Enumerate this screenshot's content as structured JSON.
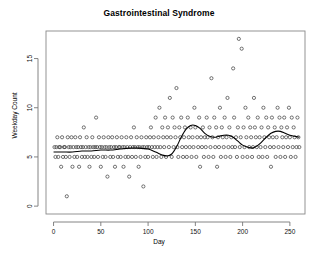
{
  "chart_data": {
    "type": "scatter",
    "title": "Gastrointestinal Syndrome",
    "xlabel": "Day",
    "ylabel": "Weekday Count",
    "xlim": [
      -8,
      266
    ],
    "ylim": [
      -0.8,
      17.8
    ],
    "xticks": [
      0,
      50,
      100,
      150,
      200,
      250
    ],
    "yticks": [
      0,
      5,
      10,
      15
    ],
    "xtick_labels": [
      "0",
      "50",
      "100",
      "150",
      "200",
      "250"
    ],
    "ytick_labels": [
      "0",
      "5",
      "10",
      "15"
    ],
    "grid": false,
    "legend": null,
    "marker": "open-circle",
    "marker_color": "#3a3a3a",
    "marker_radius": 1.6,
    "line_color": "#000000",
    "frame_color": "#888888",
    "series": [
      {
        "name": "Weekday Count",
        "type": "scatter",
        "x": [
          1,
          2,
          3,
          4,
          5,
          6,
          7,
          8,
          9,
          10,
          11,
          12,
          13,
          14,
          15,
          16,
          17,
          18,
          19,
          20,
          21,
          22,
          23,
          24,
          25,
          26,
          27,
          28,
          29,
          30,
          31,
          32,
          33,
          34,
          35,
          36,
          37,
          38,
          39,
          40,
          41,
          42,
          43,
          44,
          45,
          46,
          47,
          48,
          49,
          50,
          51,
          52,
          53,
          54,
          55,
          56,
          57,
          58,
          59,
          60,
          61,
          62,
          63,
          64,
          65,
          66,
          67,
          68,
          69,
          70,
          71,
          72,
          73,
          74,
          75,
          76,
          77,
          78,
          79,
          80,
          81,
          82,
          83,
          84,
          85,
          86,
          87,
          88,
          89,
          90,
          91,
          92,
          93,
          94,
          95,
          96,
          97,
          98,
          99,
          100,
          101,
          102,
          103,
          104,
          105,
          106,
          107,
          108,
          109,
          110,
          111,
          112,
          113,
          114,
          115,
          116,
          117,
          118,
          119,
          120,
          121,
          122,
          123,
          124,
          125,
          126,
          127,
          128,
          129,
          130,
          131,
          132,
          133,
          134,
          135,
          136,
          137,
          138,
          139,
          140,
          141,
          142,
          143,
          144,
          145,
          146,
          147,
          148,
          149,
          150,
          151,
          152,
          153,
          154,
          155,
          156,
          157,
          158,
          159,
          160,
          161,
          162,
          163,
          164,
          165,
          166,
          167,
          168,
          169,
          170,
          171,
          172,
          173,
          174,
          175,
          176,
          177,
          178,
          179,
          180,
          181,
          182,
          183,
          184,
          185,
          186,
          187,
          188,
          189,
          190,
          191,
          192,
          193,
          194,
          195,
          196,
          197,
          198,
          199,
          200,
          201,
          202,
          203,
          204,
          205,
          206,
          207,
          208,
          209,
          210,
          211,
          212,
          213,
          214,
          215,
          216,
          217,
          218,
          219,
          220,
          221,
          222,
          223,
          224,
          225,
          226,
          227,
          228,
          229,
          230,
          231,
          232,
          233,
          234,
          235,
          236,
          237,
          238,
          239,
          240,
          241,
          242,
          243,
          244,
          245,
          246,
          247,
          248,
          249,
          250,
          251,
          252,
          253,
          254,
          255,
          256,
          257,
          258,
          259,
          260
        ],
        "y": [
          6,
          5,
          6,
          7,
          5,
          6,
          6,
          4,
          7,
          5,
          6,
          6,
          5,
          1,
          7,
          6,
          5,
          6,
          7,
          4,
          6,
          5,
          7,
          6,
          5,
          6,
          4,
          7,
          6,
          5,
          6,
          8,
          5,
          6,
          7,
          5,
          6,
          4,
          6,
          5,
          7,
          6,
          5,
          6,
          9,
          6,
          5,
          7,
          6,
          4,
          6,
          5,
          7,
          6,
          5,
          6,
          3,
          7,
          6,
          5,
          6,
          7,
          5,
          6,
          4,
          6,
          7,
          5,
          6,
          6,
          5,
          7,
          6,
          4,
          6,
          5,
          7,
          6,
          5,
          3,
          6,
          7,
          5,
          6,
          8,
          6,
          5,
          7,
          6,
          4,
          6,
          5,
          7,
          6,
          2,
          6,
          5,
          7,
          6,
          5,
          6,
          7,
          8,
          6,
          5,
          7,
          6,
          9,
          5,
          6,
          7,
          10,
          6,
          5,
          8,
          7,
          6,
          9,
          5,
          7,
          8,
          6,
          11,
          7,
          5,
          9,
          6,
          8,
          7,
          12,
          6,
          5,
          8,
          7,
          9,
          6,
          5,
          7,
          8,
          6,
          5,
          9,
          7,
          6,
          8,
          5,
          7,
          6,
          10,
          8,
          5,
          7,
          6,
          9,
          4,
          7,
          6,
          8,
          5,
          7,
          6,
          9,
          7,
          5,
          8,
          6,
          13,
          7,
          5,
          9,
          6,
          8,
          4,
          7,
          6,
          10,
          5,
          8,
          7,
          6,
          9,
          5,
          7,
          11,
          6,
          8,
          5,
          7,
          6,
          14,
          9,
          6,
          7,
          5,
          8,
          17,
          6,
          7,
          16,
          5,
          8,
          6,
          10,
          7,
          5,
          9,
          6,
          8,
          7,
          5,
          6,
          11,
          8,
          7,
          6,
          9,
          5,
          7,
          6,
          8,
          5,
          10,
          7,
          6,
          9,
          5,
          8,
          7,
          6,
          4,
          9,
          7,
          6,
          8,
          5,
          7,
          10,
          6,
          9,
          5,
          8,
          7,
          6,
          9,
          5,
          7,
          8,
          6,
          10,
          7,
          5,
          9,
          6,
          8,
          7,
          5,
          6,
          9,
          7,
          6
        ]
      },
      {
        "name": "smoothed trend",
        "type": "line",
        "x": [
          0,
          10,
          20,
          30,
          40,
          50,
          60,
          70,
          80,
          90,
          100,
          108,
          115,
          120,
          125,
          130,
          135,
          140,
          145,
          150,
          155,
          160,
          165,
          170,
          175,
          180,
          185,
          190,
          195,
          200,
          205,
          210,
          215,
          220,
          225,
          230,
          235,
          240,
          245,
          250,
          255,
          260
        ],
        "y": [
          5.5,
          5.5,
          5.5,
          5.6,
          5.6,
          5.7,
          5.7,
          5.8,
          5.9,
          5.9,
          5.8,
          5.5,
          5.2,
          5.1,
          5.3,
          6.0,
          7.0,
          7.8,
          8.2,
          8.2,
          7.9,
          7.4,
          7.1,
          7.0,
          7.1,
          7.2,
          7.2,
          7.0,
          6.6,
          6.2,
          6.0,
          5.9,
          6.1,
          6.5,
          7.0,
          7.4,
          7.6,
          7.6,
          7.4,
          7.2,
          7.1,
          7.0
        ]
      }
    ]
  }
}
